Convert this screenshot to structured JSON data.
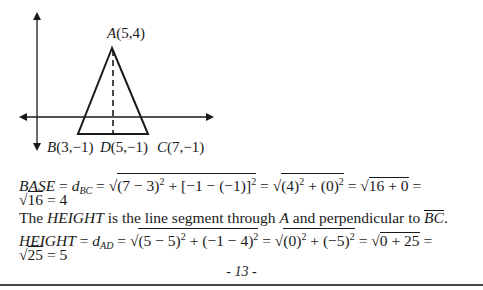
{
  "figure": {
    "points": {
      "A": {
        "label": "A(5,4)",
        "x": 5,
        "y": 4
      },
      "B": {
        "label": "B(3,−1)",
        "x": 3,
        "y": -1
      },
      "D": {
        "label": "D(5,−1)",
        "x": 5,
        "y": -1
      },
      "C": {
        "label": "C(7,−1)",
        "x": 7,
        "y": -1
      }
    },
    "labels": {
      "A_name": "A",
      "A_coords": "(5,4)",
      "B_name": "B",
      "B_coords": "(3,−1)",
      "D_name": "D",
      "D_coords": "(5,−1)",
      "C_name": "C",
      "C_coords": "(7,−1)"
    }
  },
  "base_line": {
    "lhs": "BASE",
    "eq": " = ",
    "d": "d",
    "d_sub": "BC",
    "rad1": "(7 − 3)",
    "rad1_exp": "2",
    "rad1_mid": " + [−1 − (−1)]",
    "rad1_exp2": "2",
    "rad2": "(4)",
    "rad2_exp": "2",
    "rad2_mid": " + (0)",
    "rad2_exp2": "2",
    "rad3": "16 + 0",
    "tail": " ="
  },
  "base_result": {
    "rad": "16",
    "rest": " = 4"
  },
  "height_desc": {
    "pre": "The ",
    "term": "HEIGHT",
    "mid": " is the line segment through ",
    "point": "A",
    "post": " and perpendicular to ",
    "segment": "BC",
    "end": "."
  },
  "height_line": {
    "lhs": "HEIGHT",
    "eq": " = ",
    "d": "d",
    "d_sub": "AD",
    "rad1": "(5 − 5)",
    "rad1_exp": "2",
    "rad1_mid": " + (−1 − 4)",
    "rad1_exp2": "2",
    "rad2": "(0)",
    "rad2_exp": "2",
    "rad2_mid": " + (−5)",
    "rad2_exp2": "2",
    "rad3": "0 + 25",
    "tail": " ="
  },
  "height_result": {
    "rad": "25",
    "rest": " = 5"
  },
  "footer": {
    "page_number": "- 13 -"
  }
}
